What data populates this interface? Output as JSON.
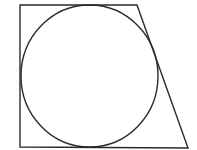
{
  "diagram": {
    "stroke_color": "#2a2a2a",
    "background": "#ffffff",
    "trapezoid": {
      "points": [
        [
          20,
          5
        ],
        [
          137,
          5
        ],
        [
          188,
          148
        ],
        [
          20,
          147
        ]
      ]
    },
    "circle": {
      "cx": 89.5,
      "cy": 76,
      "rx": 68.5,
      "ry": 71
    }
  }
}
